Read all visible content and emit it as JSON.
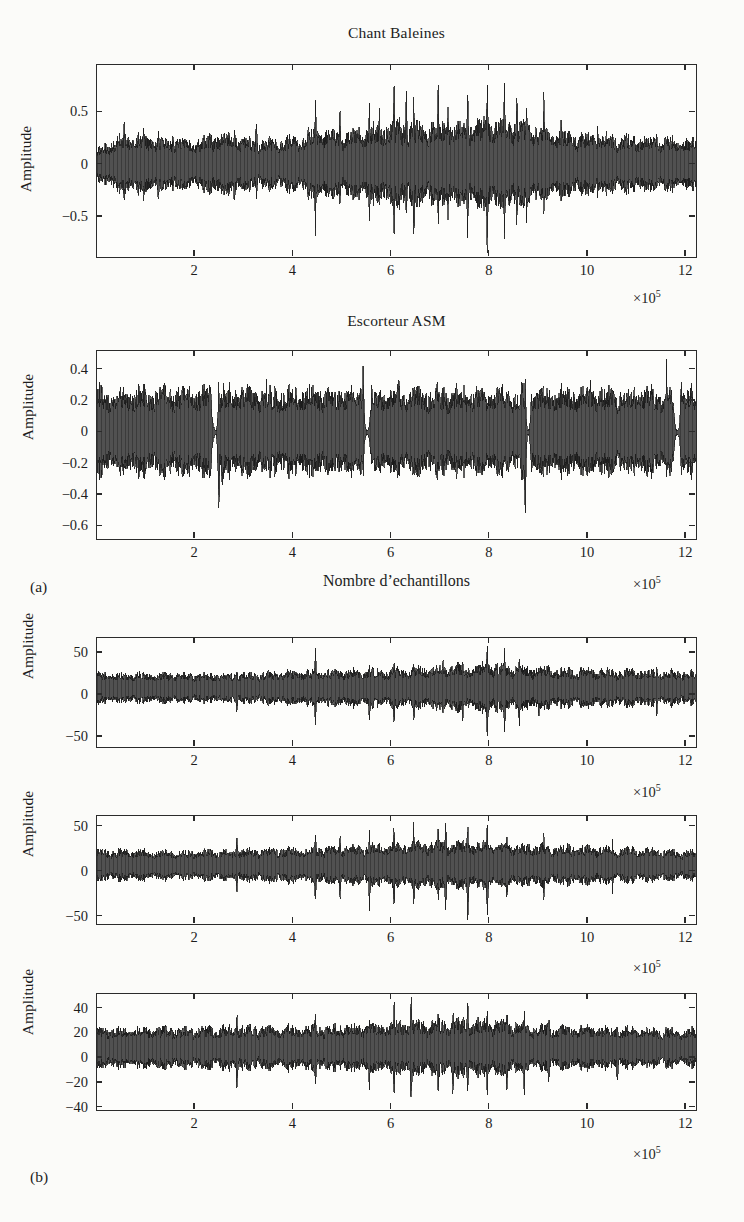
{
  "figure": {
    "subfigure_a_label": "(a)",
    "subfigure_b_label": "(b)",
    "xaxis_label": "Nombre d’echantillons",
    "exponent_label": "×10",
    "exponent_power": "5",
    "ylabel": "Amplitude"
  },
  "chart_data": [
    {
      "id": "panel-1",
      "type": "line",
      "title": "Chant Baleines",
      "xlabel": "",
      "ylabel": "Amplitude",
      "x_exponent": "×10⁵",
      "xlim": [
        0,
        12.2
      ],
      "ylim": [
        -0.88,
        0.95
      ],
      "xticks": [
        2,
        4,
        6,
        8,
        10,
        12
      ],
      "xticklabels": [
        "2",
        "4",
        "6",
        "8",
        "10",
        "12"
      ],
      "yticks": [
        0.5,
        0,
        -0.5
      ],
      "yticklabels": [
        "0.5",
        "0",
        "−0.5"
      ],
      "grid": false,
      "legend": null,
      "seed": 1771,
      "signal": {
        "description": "whale song waveform, dense noise band with intermittent high-amplitude transient spikes growing toward the centre-right",
        "baseline_amplitude": 0.17,
        "envelope_x": [
          0.0,
          0.6,
          1.2,
          1.9,
          2.6,
          3.2,
          4.0,
          4.5,
          5.0,
          5.6,
          6.1,
          6.5,
          7.0,
          7.4,
          7.9,
          8.3,
          8.8,
          9.3,
          9.9,
          10.6,
          11.3,
          12.0
        ],
        "envelope_y": [
          0.12,
          0.26,
          0.22,
          0.2,
          0.25,
          0.2,
          0.22,
          0.3,
          0.26,
          0.3,
          0.34,
          0.33,
          0.34,
          0.33,
          0.36,
          0.36,
          0.32,
          0.28,
          0.24,
          0.23,
          0.22,
          0.21
        ],
        "spikes": [
          {
            "x": 0.55,
            "up": 0.42,
            "down": -0.4
          },
          {
            "x": 0.95,
            "up": 0.4,
            "down": -0.34
          },
          {
            "x": 1.25,
            "up": 0.38,
            "down": -0.4
          },
          {
            "x": 1.55,
            "up": 0.33,
            "down": -0.3
          },
          {
            "x": 2.8,
            "up": 0.46,
            "down": -0.44
          },
          {
            "x": 3.25,
            "up": 0.48,
            "down": -0.38
          },
          {
            "x": 4.45,
            "up": 0.74,
            "down": -0.66
          },
          {
            "x": 4.95,
            "up": 0.58,
            "down": -0.46
          },
          {
            "x": 5.55,
            "up": 0.66,
            "down": -0.58
          },
          {
            "x": 5.75,
            "up": 0.52,
            "down": -0.4
          },
          {
            "x": 6.05,
            "up": 0.8,
            "down": -0.72
          },
          {
            "x": 6.3,
            "up": 0.72,
            "down": -0.58
          },
          {
            "x": 6.45,
            "up": 0.7,
            "down": -0.74
          },
          {
            "x": 6.95,
            "up": 0.82,
            "down": -0.7
          },
          {
            "x": 7.15,
            "up": 0.6,
            "down": -0.52
          },
          {
            "x": 7.55,
            "up": 0.76,
            "down": -0.72
          },
          {
            "x": 7.95,
            "up": 0.9,
            "down": -0.88
          },
          {
            "x": 8.3,
            "up": 0.84,
            "down": -0.76
          },
          {
            "x": 8.55,
            "up": 0.7,
            "down": -0.6
          },
          {
            "x": 8.75,
            "up": 0.62,
            "down": -0.56
          },
          {
            "x": 9.1,
            "up": 0.66,
            "down": -0.52
          },
          {
            "x": 9.45,
            "up": 0.46,
            "down": -0.38
          },
          {
            "x": 10.2,
            "up": 0.36,
            "down": -0.3
          },
          {
            "x": 11.4,
            "up": 0.34,
            "down": -0.28
          }
        ]
      }
    },
    {
      "id": "panel-2",
      "type": "line",
      "title": "Escorteur ASM",
      "xlabel": "Nombre d’echantillons",
      "ylabel": "Amplitude",
      "x_exponent": "×10⁵",
      "xlim": [
        0,
        12.2
      ],
      "ylim": [
        -0.68,
        0.52
      ],
      "xticks": [
        2,
        4,
        6,
        8,
        10,
        12
      ],
      "xticklabels": [
        "2",
        "4",
        "6",
        "8",
        "10",
        "12"
      ],
      "yticks": [
        0.4,
        0.2,
        0,
        -0.2,
        -0.4,
        -0.6
      ],
      "yticklabels": [
        "0.4",
        "0.2",
        "0",
        "−0.2",
        "−0.4",
        "−0.6"
      ],
      "grid": false,
      "legend": null,
      "seed": 4242,
      "signal": {
        "description": "ASM escort ship noise: saturated broadband band ~±0.24 interrupted by four narrow quiet gaps (engine transitions) at about 2.4, 5.5, 8.8 and 11.8 ×10⁵ samples",
        "baseline_amplitude": 0.235,
        "gaps": [
          2.42,
          5.5,
          8.78,
          11.82
        ],
        "gap_halfwidth": 0.1,
        "spikes": [
          {
            "x": 2.48,
            "up": 0.3,
            "down": -0.54
          },
          {
            "x": 2.55,
            "up": 0.26,
            "down": -0.4
          },
          {
            "x": 5.42,
            "up": 0.44,
            "down": -0.3
          },
          {
            "x": 5.6,
            "up": 0.32,
            "down": -0.28
          },
          {
            "x": 8.72,
            "up": 0.34,
            "down": -0.62
          },
          {
            "x": 8.85,
            "up": 0.3,
            "down": -0.32
          },
          {
            "x": 11.6,
            "up": 0.46,
            "down": -0.3
          },
          {
            "x": 11.9,
            "up": 0.4,
            "down": -0.28
          },
          {
            "x": 1.2,
            "up": 0.36,
            "down": -0.26
          },
          {
            "x": 3.45,
            "up": 0.34,
            "down": -0.26
          },
          {
            "x": 6.15,
            "up": 0.36,
            "down": -0.26
          },
          {
            "x": 7.3,
            "up": 0.34,
            "down": -0.26
          },
          {
            "x": 10.05,
            "up": 0.34,
            "down": -0.26
          }
        ]
      }
    },
    {
      "id": "panel-3",
      "type": "line",
      "title": "",
      "xlabel": "",
      "ylabel": "Amplitude",
      "x_exponent": "×10⁵",
      "xlim": [
        0,
        12.2
      ],
      "ylim": [
        -62,
        68
      ],
      "xticks": [
        2,
        4,
        6,
        8,
        10,
        12
      ],
      "xticklabels": [
        "2",
        "4",
        "6",
        "8",
        "10",
        "12"
      ],
      "yticks": [
        50,
        0,
        -50
      ],
      "yticklabels": [
        "50",
        "0",
        "−50"
      ],
      "grid": false,
      "legend": null,
      "seed": 9013,
      "signal": {
        "description": "reconstructed / separated source 1: noise band around +12 mean with transients increasing near 8×10⁵",
        "baseline_amplitude": 18,
        "offset": 8,
        "envelope_x": [
          0.0,
          1.5,
          3.0,
          4.5,
          5.8,
          6.6,
          7.4,
          8.0,
          8.6,
          9.6,
          10.8,
          12.0
        ],
        "envelope_y": [
          16,
          15,
          15,
          18,
          19,
          21,
          23,
          25,
          22,
          20,
          19,
          17
        ],
        "spikes": [
          {
            "x": 4.45,
            "up": 54,
            "down": -38
          },
          {
            "x": 5.55,
            "up": 40,
            "down": -34
          },
          {
            "x": 6.05,
            "up": 48,
            "down": -40
          },
          {
            "x": 6.45,
            "up": 42,
            "down": -34
          },
          {
            "x": 7.05,
            "up": 46,
            "down": -30
          },
          {
            "x": 7.45,
            "up": 48,
            "down": -34
          },
          {
            "x": 7.95,
            "up": 64,
            "down": -58
          },
          {
            "x": 8.3,
            "up": 58,
            "down": -50
          },
          {
            "x": 8.6,
            "up": 46,
            "down": -42
          },
          {
            "x": 9.0,
            "up": 42,
            "down": -30
          },
          {
            "x": 2.85,
            "up": 36,
            "down": -28
          },
          {
            "x": 11.4,
            "up": 34,
            "down": -26
          }
        ]
      }
    },
    {
      "id": "panel-4",
      "type": "line",
      "title": "",
      "xlabel": "",
      "ylabel": "Amplitude",
      "x_exponent": "×10⁵",
      "xlim": [
        0,
        12.2
      ],
      "ylim": [
        -58,
        62
      ],
      "xticks": [
        2,
        4,
        6,
        8,
        10,
        12
      ],
      "xticklabels": [
        "2",
        "4",
        "6",
        "8",
        "10",
        "12"
      ],
      "yticks": [
        50,
        0,
        -50
      ],
      "yticklabels": [
        "50",
        "0",
        "−50"
      ],
      "grid": false,
      "legend": null,
      "seed": 2357,
      "signal": {
        "description": "reconstructed / separated source 2: similar noise band with strong impulsive events between 5.5 and 8.5 ×10⁵",
        "baseline_amplitude": 17,
        "offset": 7,
        "envelope_x": [
          0.0,
          1.5,
          3.0,
          4.4,
          5.6,
          6.4,
          7.2,
          8.0,
          8.8,
          9.8,
          11.0,
          12.0
        ],
        "envelope_y": [
          15,
          14,
          15,
          17,
          19,
          21,
          22,
          21,
          19,
          18,
          16,
          14
        ],
        "spikes": [
          {
            "x": 2.85,
            "up": 46,
            "down": -30
          },
          {
            "x": 4.45,
            "up": 50,
            "down": -42
          },
          {
            "x": 4.95,
            "up": 44,
            "down": -32
          },
          {
            "x": 5.55,
            "up": 48,
            "down": -44
          },
          {
            "x": 6.05,
            "up": 56,
            "down": -46
          },
          {
            "x": 6.45,
            "up": 52,
            "down": -40
          },
          {
            "x": 6.95,
            "up": 50,
            "down": -38
          },
          {
            "x": 7.1,
            "up": 54,
            "down": -48
          },
          {
            "x": 7.55,
            "up": 58,
            "down": -56
          },
          {
            "x": 7.95,
            "up": 56,
            "down": -54
          },
          {
            "x": 8.35,
            "up": 46,
            "down": -36
          },
          {
            "x": 9.1,
            "up": 42,
            "down": -30
          },
          {
            "x": 10.5,
            "up": 34,
            "down": -24
          }
        ]
      }
    },
    {
      "id": "panel-5",
      "type": "line",
      "title": "",
      "xlabel": "",
      "ylabel": "Amplitude",
      "x_exponent": "×10⁵",
      "xlim": [
        0,
        12.2
      ],
      "ylim": [
        -42,
        52
      ],
      "xticks": [
        2,
        4,
        6,
        8,
        10,
        12
      ],
      "xticklabels": [
        "2",
        "4",
        "6",
        "8",
        "10",
        "12"
      ],
      "yticks": [
        40,
        20,
        0,
        -20,
        -40
      ],
      "yticklabels": [
        "40",
        "20",
        "0",
        "−20",
        "−40"
      ],
      "grid": false,
      "legend": null,
      "seed": 6180,
      "signal": {
        "description": "reconstructed / separated source 3: dense band offset near +10 with transient bursts concentrated between 6 and 9 ×10⁵",
        "baseline_amplitude": 14,
        "offset": 8,
        "envelope_x": [
          0.0,
          1.4,
          2.8,
          4.2,
          5.4,
          6.2,
          7.0,
          7.8,
          8.6,
          9.6,
          10.8,
          12.0
        ],
        "envelope_y": [
          14,
          14,
          15,
          15,
          16,
          18,
          19,
          19,
          17,
          15,
          14,
          13
        ],
        "spikes": [
          {
            "x": 2.85,
            "up": 42,
            "down": -32
          },
          {
            "x": 4.45,
            "up": 40,
            "down": -30
          },
          {
            "x": 5.55,
            "up": 34,
            "down": -28
          },
          {
            "x": 6.05,
            "up": 44,
            "down": -34
          },
          {
            "x": 6.4,
            "up": 48,
            "down": -40
          },
          {
            "x": 6.95,
            "up": 46,
            "down": -34
          },
          {
            "x": 7.25,
            "up": 44,
            "down": -32
          },
          {
            "x": 7.55,
            "up": 50,
            "down": -38
          },
          {
            "x": 7.95,
            "up": 44,
            "down": -34
          },
          {
            "x": 8.35,
            "up": 46,
            "down": -36
          },
          {
            "x": 8.7,
            "up": 40,
            "down": -30
          },
          {
            "x": 9.2,
            "up": 36,
            "down": -26
          },
          {
            "x": 10.6,
            "up": 32,
            "down": -24
          }
        ]
      }
    }
  ]
}
